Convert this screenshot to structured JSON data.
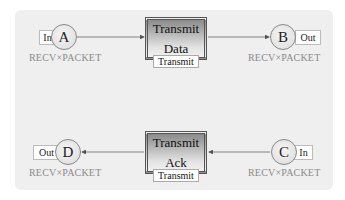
{
  "diagram": {
    "type": "petri-net",
    "places": [
      {
        "id": "A",
        "label": "A",
        "port": "In",
        "color_set": "RECV×PACKET"
      },
      {
        "id": "B",
        "label": "B",
        "port": "Out",
        "color_set": "RECV×PACKET"
      },
      {
        "id": "C",
        "label": "C",
        "port": "In",
        "color_set": "RECV×PACKET"
      },
      {
        "id": "D",
        "label": "D",
        "port": "Out",
        "color_set": "RECV×PACKET"
      }
    ],
    "transitions": [
      {
        "id": "transmit-data",
        "line1": "Transmit",
        "line2": "Data",
        "subpage_tag": "Transmit"
      },
      {
        "id": "transmit-ack",
        "line1": "Transmit",
        "line2": "Ack",
        "subpage_tag": "Transmit"
      }
    ],
    "arcs": [
      {
        "from": "A",
        "to": "transmit-data"
      },
      {
        "from": "transmit-data",
        "to": "B"
      },
      {
        "from": "C",
        "to": "transmit-ack"
      },
      {
        "from": "transmit-ack",
        "to": "D"
      }
    ],
    "colors": {
      "panel_bg": "#efefef",
      "arc": "#555555",
      "color_set_text": "#8a8a8a"
    }
  }
}
